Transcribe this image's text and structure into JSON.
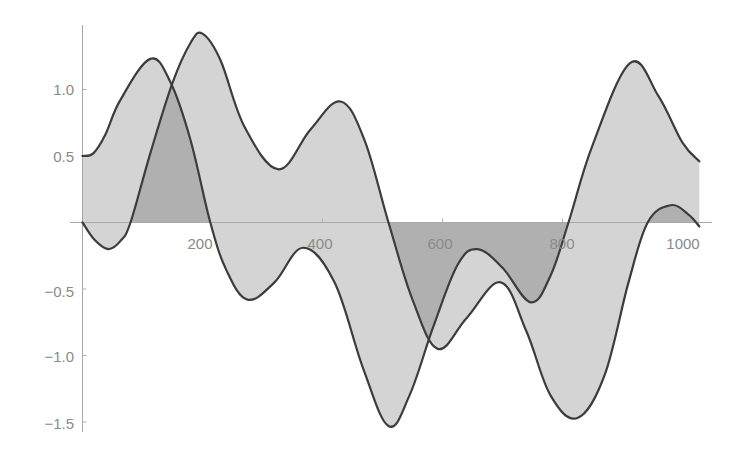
{
  "chart_data": {
    "type": "area",
    "title": "",
    "xlabel": "",
    "ylabel": "",
    "xlim": [
      0,
      1028
    ],
    "ylim": [
      -1.6,
      1.45
    ],
    "grid": false,
    "legend": null,
    "filling": "to axis (overlapping fills appear darker)",
    "x_ticks": [
      200,
      400,
      600,
      800,
      1000
    ],
    "x_tick_labels": [
      "200",
      "400",
      "600",
      "800",
      "1000"
    ],
    "y_ticks": [
      -1.5,
      -1.0,
      -0.5,
      0.5,
      1.0
    ],
    "y_tick_labels": [
      "-1.5",
      "-1.0",
      "-0.5",
      "0.5",
      "1.0"
    ],
    "series": [
      {
        "name": "curve-1",
        "x": [
          0,
          18,
          38,
          63,
          113,
          147,
          180,
          213,
          240,
          275,
          320,
          368,
          420,
          468,
          510,
          545,
          585,
          625,
          658,
          700,
          747,
          780,
          810,
          850,
          913,
          960,
          1000,
          1028
        ],
        "y": [
          0.5,
          0.52,
          0.66,
          0.92,
          1.23,
          1.05,
          0.62,
          0.0,
          -0.36,
          -0.58,
          -0.45,
          -0.19,
          -0.45,
          -1.1,
          -1.53,
          -1.3,
          -0.78,
          -0.32,
          -0.2,
          -0.34,
          -0.6,
          -0.4,
          0.0,
          0.58,
          1.2,
          0.95,
          0.6,
          0.46
        ]
      },
      {
        "name": "curve-2",
        "x": [
          0,
          20,
          43,
          63,
          80,
          113,
          150,
          180,
          200,
          230,
          270,
          327,
          380,
          430,
          470,
          510,
          550,
          592,
          640,
          697,
          740,
          780,
          825,
          870,
          910,
          942,
          980,
          1010,
          1028
        ],
        "y": [
          0.0,
          -0.13,
          -0.2,
          -0.14,
          0.0,
          0.52,
          1.05,
          1.35,
          1.42,
          1.22,
          0.72,
          0.4,
          0.7,
          0.91,
          0.62,
          0.0,
          -0.58,
          -0.95,
          -0.72,
          -0.45,
          -0.82,
          -1.3,
          -1.47,
          -1.15,
          -0.45,
          0.0,
          0.13,
          0.06,
          -0.03
        ]
      }
    ]
  },
  "axes": {
    "x_labels": [
      "200",
      "400",
      "600",
      "800",
      "1000"
    ],
    "y_labels": [
      "1.0",
      "0.5",
      "-0.5",
      "-1.0",
      "-1.5"
    ]
  }
}
